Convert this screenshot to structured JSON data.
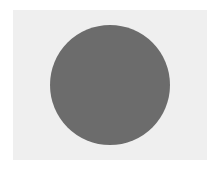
{
  "scene": {
    "background_color": "#ffffff",
    "panel": {
      "color": "#efefef"
    },
    "shapes": [
      {
        "type": "circle",
        "color": "#6c6c6c",
        "cx": 109.5,
        "cy": 85,
        "r": 60
      }
    ]
  }
}
